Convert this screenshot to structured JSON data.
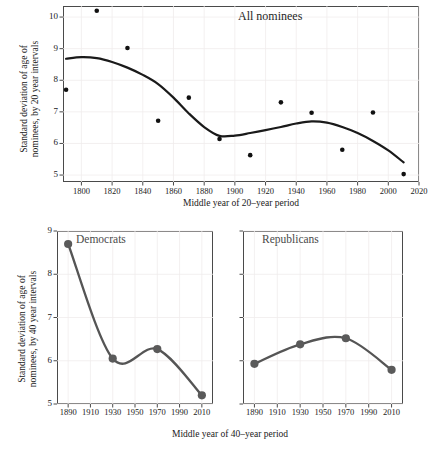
{
  "figure": {
    "panels": [
      "All nominees",
      "Democrats",
      "Republicans"
    ]
  },
  "top": {
    "title": "All nominees",
    "xlabel": "Middle year of 20–year period",
    "ylabel_line1": "Standard deviation of age of",
    "ylabel_line2": "nominees, by 20 year intervals",
    "yticks": [
      "5",
      "6",
      "7",
      "8",
      "9",
      "10"
    ],
    "xticks": [
      "1800",
      "1820",
      "1840",
      "1860",
      "1880",
      "1900",
      "1920",
      "1940",
      "1960",
      "1980",
      "2000",
      "2020"
    ]
  },
  "bottom": {
    "xlabel": "Middle year of 40–year period",
    "ylabel_line1": "Standard deviation of age of",
    "ylabel_line2": "nominees, by 40 year intervals",
    "yticks": [
      "5",
      "6",
      "7",
      "8",
      "9"
    ],
    "xticks": [
      "1890",
      "1910",
      "1930",
      "1950",
      "1970",
      "1990",
      "2010"
    ],
    "left_title": "Democrats",
    "right_title": "Republicans"
  },
  "colors": {
    "point": "#111111",
    "trend_line": "#1a1a1a",
    "series_line": "#555555",
    "series_marker": "#5a5a5a",
    "frame": "#4a4a4a",
    "grid": "#f0ecec",
    "background": "#ffffff"
  },
  "chart_data": [
    {
      "type": "scatter",
      "title": "All nominees",
      "xlabel": "Middle year of 20–year period",
      "ylabel": "Standard deviation of age of nominees, by 20 year intervals",
      "xlim": [
        1788,
        2020
      ],
      "ylim": [
        4.78,
        10.35
      ],
      "grid": true,
      "legend": "none",
      "x": [
        1790,
        1810,
        1830,
        1850,
        1870,
        1890,
        1910,
        1930,
        1950,
        1970,
        1990,
        2010
      ],
      "values": [
        7.7,
        10.2,
        9.02,
        6.72,
        7.45,
        6.14,
        5.63,
        7.3,
        6.97,
        5.8,
        6.98,
        5.03
      ],
      "smooth_line": {
        "name": "loess trend",
        "x": [
          1790,
          1800,
          1810,
          1820,
          1830,
          1840,
          1850,
          1860,
          1870,
          1880,
          1890,
          1900,
          1910,
          1920,
          1930,
          1940,
          1950,
          1960,
          1970,
          1980,
          1990,
          2000,
          2010
        ],
        "values": [
          8.68,
          8.73,
          8.7,
          8.58,
          8.4,
          8.17,
          7.88,
          7.45,
          6.95,
          6.52,
          6.24,
          6.25,
          6.33,
          6.42,
          6.52,
          6.63,
          6.7,
          6.66,
          6.52,
          6.33,
          6.08,
          5.78,
          5.4
        ]
      }
    },
    {
      "type": "line",
      "title": "Democrats",
      "xlabel": "Middle year of 40–year period",
      "ylabel": "Standard deviation of age of nominees, by 40 year intervals",
      "xlim": [
        1880,
        2020
      ],
      "ylim": [
        5.0,
        9.0
      ],
      "grid": true,
      "legend": "none",
      "categories": [
        1890,
        1930,
        1970,
        2010
      ],
      "values": [
        8.7,
        6.05,
        6.27,
        5.2
      ]
    },
    {
      "type": "line",
      "title": "Republicans",
      "xlabel": "Middle year of 40–year period",
      "ylabel": "Standard deviation of age of nominees, by 40 year intervals",
      "xlim": [
        1880,
        2020
      ],
      "ylim": [
        5.0,
        9.0
      ],
      "grid": true,
      "legend": "none",
      "categories": [
        1890,
        1930,
        1970,
        2010
      ],
      "values": [
        5.93,
        6.38,
        6.52,
        5.79
      ]
    }
  ]
}
